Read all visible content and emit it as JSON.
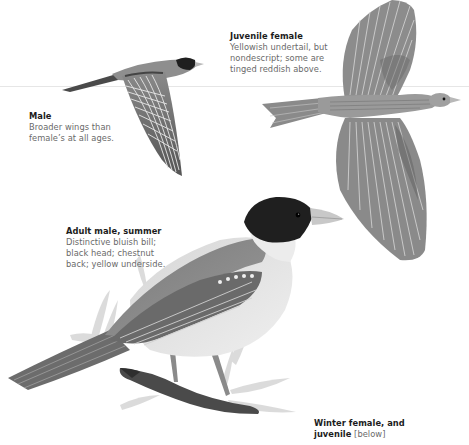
{
  "captions": {
    "juvenile_female": {
      "title": "Juvenile female",
      "lines": [
        "Yellowish undertail, but",
        "nondescript; some are",
        "tinged reddish above."
      ]
    },
    "male_flight": {
      "title": "Male",
      "lines": [
        "Broader wings than",
        "female’s at all ages."
      ]
    },
    "adult_male_summer": {
      "title": "Adult male, summer",
      "lines": [
        "Distinctive bluish bill;",
        "black head; chestnut",
        "back; yellow underside."
      ]
    },
    "winter_female": {
      "title_line1": "Winter female, and",
      "title_line2": "juvenile",
      "note": "[below]"
    }
  },
  "illustrations": [
    {
      "name": "male-in-flight",
      "subject": "Male, side view in flight"
    },
    {
      "name": "juvenile-female-in-flight",
      "subject": "Juvenile female, top view, wings spread"
    },
    {
      "name": "adult-male-summer-perched",
      "subject": "Adult male, summer, perched on branch"
    }
  ],
  "colors": {
    "caption_title": "#1c1c1c",
    "caption_text": "#6a6a6a",
    "rule": "#e6e6e6",
    "head_black": "#1f1f1f"
  }
}
